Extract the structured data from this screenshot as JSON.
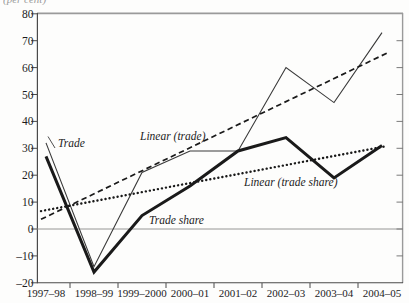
{
  "figure": {
    "top_cropped_text": "(per cent)"
  },
  "chart_data": {
    "type": "line",
    "title": "",
    "xlabel": "",
    "ylabel": "",
    "ylim": [
      -20,
      80
    ],
    "y_tick_step": 10,
    "y_ticks": [
      "80",
      "70",
      "60",
      "50",
      "40",
      "30",
      "20",
      "10",
      "0",
      "–10",
      "–20"
    ],
    "y_tick_values": [
      80,
      70,
      60,
      50,
      40,
      30,
      20,
      10,
      0,
      -10,
      -20
    ],
    "categories": [
      "1997–98",
      "1998–99",
      "1999–2000",
      "2000–01",
      "2001–02",
      "2002–03",
      "2003–04",
      "2004–05"
    ],
    "x_tick_placement": "between-categories",
    "grid": "off",
    "legend": "none (inline italic annotations)",
    "zero_line": true,
    "series": [
      {
        "name": "Trade",
        "style": "thin-solid",
        "values": [
          32,
          -14,
          21,
          29,
          29,
          60,
          47,
          73
        ]
      },
      {
        "name": "Trade share",
        "style": "thick-solid",
        "values": [
          27,
          -16,
          5,
          16,
          29,
          34,
          19,
          31
        ]
      },
      {
        "name": "Linear (trade)",
        "style": "dashed",
        "trend": {
          "start": 4.5,
          "end": 64.5
        }
      },
      {
        "name": "Linear (trade share)",
        "style": "dotted",
        "trend": {
          "start": 7,
          "end": 30.5
        }
      }
    ],
    "labels": {
      "trade": "Trade",
      "linear_trade": "Linear (trade)",
      "trade_share": "Trade share",
      "linear_trade_share": "Linear (trade share)"
    },
    "colors": {
      "line": "#1a1a1a",
      "thin_line": "#3a3a3a",
      "axis": "#4a4a4a",
      "box_border": "#9a9a9a",
      "zero_line": "#8a8a8a",
      "text": "#1c1c1c",
      "background": "#fdfdfc"
    }
  }
}
